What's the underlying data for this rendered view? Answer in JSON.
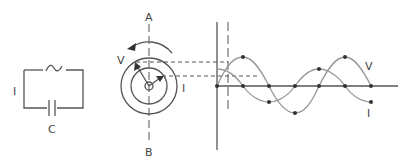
{
  "circuit": {
    "current_label": "I",
    "capacitor_label": "C",
    "source_symbol": "~"
  },
  "phasor": {
    "axis_top_label": "A",
    "axis_bottom_label": "B",
    "voltage_label": "V",
    "current_label": "I",
    "rotation": "counterclockwise"
  },
  "waveform": {
    "voltage_label": "V",
    "current_label": "I",
    "description": "Current leads voltage by 90 degrees in a capacitive AC circuit"
  }
}
